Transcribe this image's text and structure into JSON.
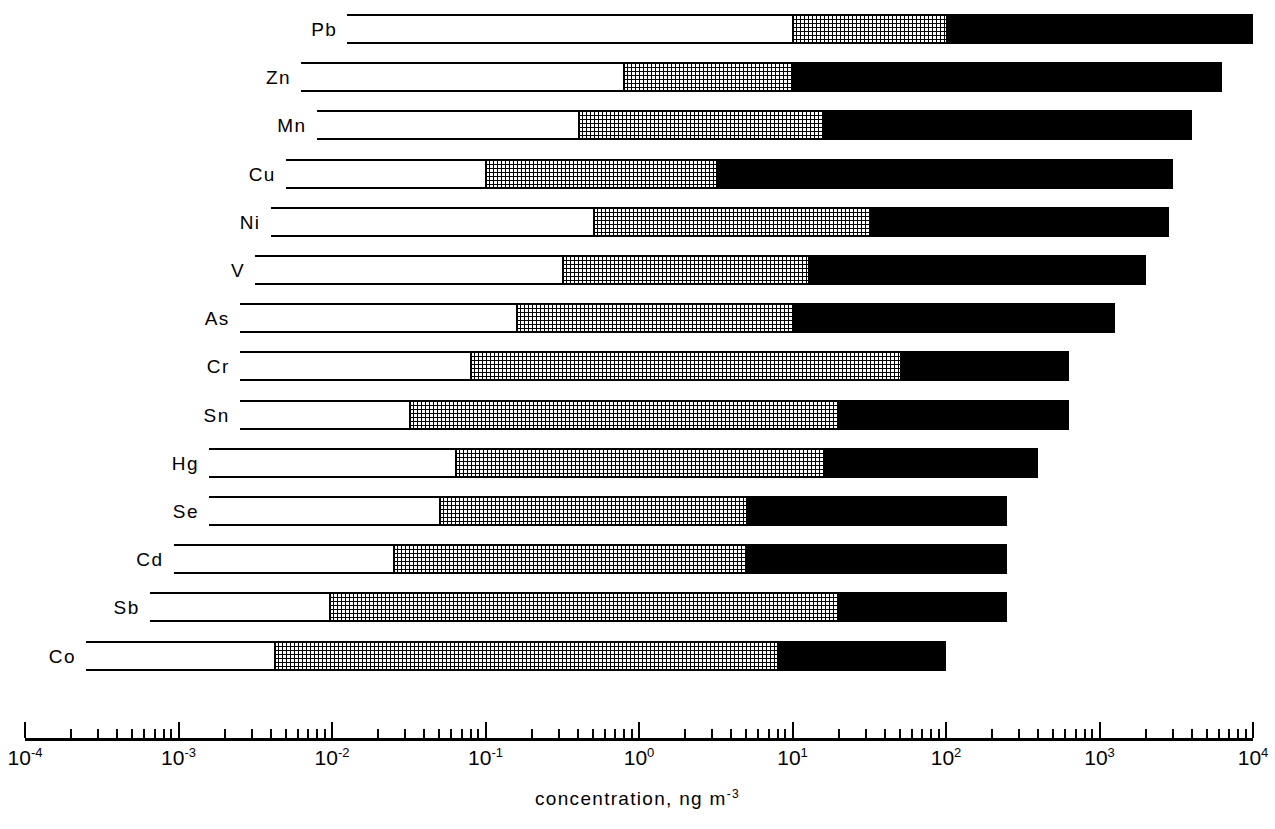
{
  "chart_data": {
    "type": "bar",
    "title": "",
    "subtitle": "",
    "xlabel": "concentration, ng m-3",
    "xlabel_base": "concentration, ng m",
    "xlabel_exponent": "-3",
    "ylabel": "",
    "orientation": "horizontal",
    "xscale": "log",
    "xlim": [
      0.0001,
      10000
    ],
    "grid": false,
    "legend": "none",
    "tick_labels": [
      "10-4",
      "10-3",
      "10-2",
      "10-1",
      "100",
      "101",
      "102",
      "103",
      "104"
    ],
    "tick_mantissas": [
      "10",
      "10",
      "10",
      "10",
      "10",
      "10",
      "10",
      "10",
      "10"
    ],
    "tick_exponents": [
      "-4",
      "-3",
      "-2",
      "-1",
      "0",
      "1",
      "2",
      "3",
      "4"
    ],
    "tick_values": [
      0.0001,
      0.001,
      0.01,
      0.1,
      1,
      10,
      100,
      1000,
      10000
    ],
    "categories": [
      "Pb",
      "Zn",
      "Mn",
      "Cu",
      "Ni",
      "V",
      "As",
      "Cr",
      "Sn",
      "Hg",
      "Se",
      "Cd",
      "Sb",
      "Co"
    ],
    "segment_names": [
      "remote",
      "rural",
      "urban"
    ],
    "segment_styles": [
      "white",
      "stippled",
      "black"
    ],
    "series": [
      {
        "name": "remote",
        "style": "white",
        "values": [
          [
            0.0126,
            10.0
          ],
          [
            0.0063,
            0.79
          ],
          [
            0.00794,
            0.398
          ],
          [
            0.00501,
            0.1
          ],
          [
            0.00398,
            0.501
          ],
          [
            0.00316,
            0.316
          ],
          [
            0.00251,
            0.158
          ],
          [
            0.00251,
            0.079
          ],
          [
            0.00251,
            0.0316
          ],
          [
            0.00158,
            0.0631
          ],
          [
            0.00158,
            0.0501
          ],
          [
            0.00093,
            0.0251
          ],
          [
            0.00065,
            0.00955
          ],
          [
            0.00025,
            0.00417
          ]
        ]
      },
      {
        "name": "rural",
        "style": "stippled",
        "values": [
          [
            10.0,
            100.0
          ],
          [
            0.79,
            10.0
          ],
          [
            0.398,
            15.8
          ],
          [
            0.1,
            3.16
          ],
          [
            0.501,
            31.6
          ],
          [
            0.316,
            12.6
          ],
          [
            0.158,
            10.0
          ],
          [
            0.079,
            50.1
          ],
          [
            0.0316,
            19.9
          ],
          [
            0.0631,
            15.8
          ],
          [
            0.0501,
            5.01
          ],
          [
            0.0251,
            5.01
          ],
          [
            0.00955,
            19.9
          ],
          [
            0.00417,
            7.94
          ]
        ]
      },
      {
        "name": "urban",
        "style": "black",
        "values": [
          [
            100.0,
            10000.0
          ],
          [
            10.0,
            6310.0
          ],
          [
            15.8,
            3980.0
          ],
          [
            3.16,
            3020.0
          ],
          [
            31.6,
            2820.0
          ],
          [
            12.6,
            1995.0
          ],
          [
            10.0,
            1259.0
          ],
          [
            50.1,
            631.0
          ],
          [
            19.9,
            631.0
          ],
          [
            15.8,
            398.0
          ],
          [
            5.01,
            251.0
          ],
          [
            5.01,
            251.0
          ],
          [
            19.9,
            251.0
          ],
          [
            7.94,
            100.0
          ]
        ]
      }
    ],
    "bars": [
      {
        "label": "Pb",
        "start": 0.0126,
        "mid_start": 10.0,
        "mid_end": 100.0,
        "end": 10000.0
      },
      {
        "label": "Zn",
        "start": 0.0063,
        "mid_start": 0.79,
        "mid_end": 10.0,
        "end": 6310.0
      },
      {
        "label": "Mn",
        "start": 0.00794,
        "mid_start": 0.398,
        "mid_end": 15.8,
        "end": 3980.0
      },
      {
        "label": "Cu",
        "start": 0.00501,
        "mid_start": 0.1,
        "mid_end": 3.16,
        "end": 3020.0
      },
      {
        "label": "Ni",
        "start": 0.00398,
        "mid_start": 0.501,
        "mid_end": 31.6,
        "end": 2820.0
      },
      {
        "label": "V",
        "start": 0.00316,
        "mid_start": 0.316,
        "mid_end": 12.6,
        "end": 1995.0
      },
      {
        "label": "As",
        "start": 0.00251,
        "mid_start": 0.158,
        "mid_end": 10.0,
        "end": 1259.0
      },
      {
        "label": "Cr",
        "start": 0.00251,
        "mid_start": 0.079,
        "mid_end": 50.1,
        "end": 631.0
      },
      {
        "label": "Sn",
        "start": 0.00251,
        "mid_start": 0.0316,
        "mid_end": 19.9,
        "end": 631.0
      },
      {
        "label": "Hg",
        "start": 0.00158,
        "mid_start": 0.0631,
        "mid_end": 15.8,
        "end": 398.0
      },
      {
        "label": "Se",
        "start": 0.00158,
        "mid_start": 0.0501,
        "mid_end": 5.01,
        "end": 251.0
      },
      {
        "label": "Cd",
        "start": 0.00093,
        "mid_start": 0.0251,
        "mid_end": 5.01,
        "end": 251.0
      },
      {
        "label": "Sb",
        "start": 0.00065,
        "mid_start": 0.00955,
        "mid_end": 19.9,
        "end": 251.0
      },
      {
        "label": "Co",
        "start": 0.00025,
        "mid_start": 0.00417,
        "mid_end": 7.94,
        "end": 100.0
      }
    ]
  },
  "axis": {
    "title_base": "concentration, ng m",
    "title_exponent": "-3"
  }
}
